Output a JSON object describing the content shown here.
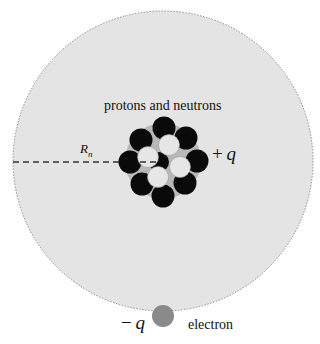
{
  "diagram": {
    "atom": {
      "region_color": "#e4e4e4",
      "border_style": "dotted",
      "border_color": "#888888"
    },
    "nucleus": {
      "label": "protons and neutrons",
      "charge_sign": "+",
      "charge_symbol": "q",
      "halo_color": "#b8b8b8",
      "proton_color": "#0a0a0a",
      "neutron_color": "#e6e6e6",
      "proton_count": 8,
      "neutron_count": 4
    },
    "radius": {
      "symbol": "R",
      "subscript": "n",
      "line_style": "dashed"
    },
    "electron": {
      "label": "electron",
      "charge_sign": "−",
      "charge_symbol": "q",
      "color": "#8a8a8a"
    }
  }
}
